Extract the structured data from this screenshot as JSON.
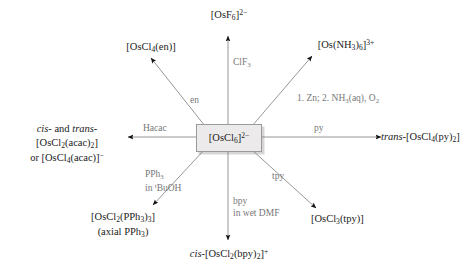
{
  "diagram": {
    "center": {
      "label": "[OsCl6]2-",
      "html": "[OsCl<sub>6</sub>]<sup>2&minus;</sup>"
    },
    "arrow_color": "#8a8a8a",
    "arrowhead_color": "#111111",
    "reagent_color": "#777777",
    "product_color": "#1a1a1a",
    "box_fill": "#eceaea",
    "box_border": "#9a9a9a",
    "products": [
      {
        "id": "osf6",
        "label": "[OsF6]2-",
        "html": "[OsF<sub>6</sub>]<sup>2&minus;</sup>"
      },
      {
        "id": "oscl4en",
        "label": "[OsCl4(en)]",
        "html": "[OsCl<sub>4</sub>(en)]"
      },
      {
        "id": "osnh3",
        "label": "[Os(NH3)6]3+",
        "html": "[Os(NH<sub>3</sub>)<sub>6</sub>]<sup>3+</sup>"
      },
      {
        "id": "acac",
        "label": "cis- and trans-[OsCl2(acac)2] or [OsCl4(acac)]-",
        "html": "<i>cis</i>- and <i>trans</i>-[OsCl<sub>2</sub>(acac)<sub>2</sub>]<br>or [OsCl<sub>4</sub>(acac)]<sup>&minus;</sup>"
      },
      {
        "id": "ospy",
        "label": "trans-[OsCl4(py)2]",
        "html": "<i>trans</i>-[OsCl<sub>4</sub>(py)<sub>2</sub>]"
      },
      {
        "id": "ospph3",
        "label": "[OsCl2(PPh3)3] (axial PPh3)",
        "html": "[OsCl<sub>2</sub>(PPh<sub>3</sub>)<sub>3</sub>]<br>(axial PPh<sub>3</sub>)"
      },
      {
        "id": "osbpy",
        "label": "cis-[OsCl2(bpy)2]+",
        "html": "<i>cis</i>-[OsCl<sub>2</sub>(bpy)<sub>2</sub>]<sup>+</sup>"
      },
      {
        "id": "ostpy",
        "label": "[OsCl3(tpy)]",
        "html": "[OsCl<sub>3</sub>(tpy)]"
      }
    ],
    "reagents": [
      {
        "id": "clf3",
        "label": "ClF3",
        "html": "ClF<sub>3</sub>"
      },
      {
        "id": "en",
        "label": "en",
        "html": "en"
      },
      {
        "id": "znnh3",
        "label": "1. Zn; 2. NH3(aq), O2",
        "html": "1. Zn; 2. NH<sub>3</sub>(aq), O<sub>2</sub>"
      },
      {
        "id": "hacac",
        "label": "Hacac",
        "html": "Hacac"
      },
      {
        "id": "py",
        "label": "py",
        "html": "py"
      },
      {
        "id": "pph3",
        "label": "PPh3 in tBuOH",
        "html": "PPh<sub>3</sub><br>in <sup>t</sup>BuOH"
      },
      {
        "id": "bpy",
        "label": "bpy in wet DMF",
        "html": "bpy<br>in wet DMF"
      },
      {
        "id": "tpy",
        "label": "tpy",
        "html": "tpy"
      }
    ]
  }
}
